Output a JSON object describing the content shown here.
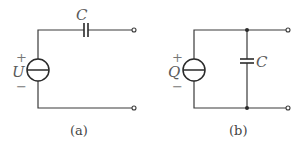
{
  "figure": {
    "a": {
      "caption": "(a)",
      "source_label": "U",
      "plus": "+",
      "minus": "−",
      "capacitor_label": "C"
    },
    "b": {
      "caption": "(b)",
      "source_label": "Q",
      "plus": "+",
      "minus": "−",
      "capacitor_label": "C"
    }
  }
}
